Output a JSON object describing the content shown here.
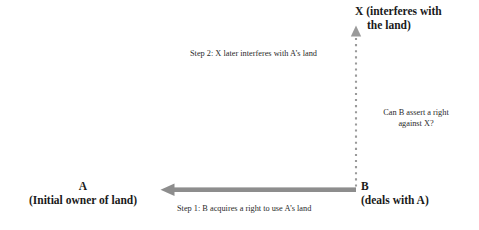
{
  "diagram": {
    "background_color": "#ffffff",
    "arrow_color": "#8a8a8a",
    "text_color": "#1a1a1a",
    "caption_color": "#2a2a2a",
    "nodes": {
      "a": {
        "name": "A",
        "description": "(Initial owner of land)"
      },
      "b": {
        "name": "B",
        "description": "(deals with A)"
      },
      "x": {
        "line1": "X (interferes with",
        "line2": "the land)",
        "full": "X (interferes with the land)"
      }
    },
    "captions": {
      "step1": "Step 1: B acquires a right to use A’s land",
      "step2": "Step 2: X later interferes with A’s land",
      "question_line1": "Can B assert a right",
      "question_line2": "against X?"
    },
    "connectors": {
      "horizontal": {
        "label": "step-1-arrow",
        "style": "solid",
        "direction": "right-to-left",
        "from": "B",
        "to": "A"
      },
      "vertical": {
        "label": "step-2-arrow",
        "style": "dotted",
        "direction": "bottom-to-top",
        "from": "B",
        "to": "X"
      }
    }
  }
}
